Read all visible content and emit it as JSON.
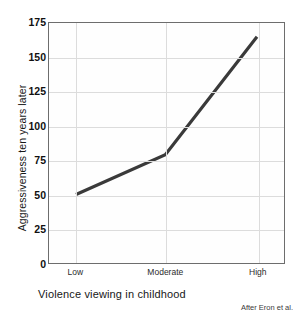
{
  "chart_data": {
    "type": "line",
    "title": "",
    "subtitle": "",
    "xlabel": "Violence viewing in childhood",
    "ylabel": "Aggressiveness ten years later",
    "categories": [
      "Low",
      "Moderate",
      "High"
    ],
    "values": [
      50,
      79,
      165
    ],
    "series": [
      {
        "name": "Aggressiveness",
        "values": [
          50,
          79,
          165
        ]
      }
    ],
    "ylim": [
      0,
      175
    ],
    "yticks": [
      0,
      25,
      50,
      75,
      100,
      125,
      150,
      175
    ],
    "ytick_labels": [
      "0",
      "25",
      "50",
      "75",
      "100",
      "125",
      "150",
      "175"
    ],
    "xtick_labels": [
      "Low",
      "Moderate",
      "High"
    ],
    "grid": true,
    "legend": false,
    "legend_position": "none",
    "annotations": [
      "After Eron et al."
    ],
    "line_color": "#3a3a3a",
    "grid_color": "#dcdcdc",
    "axis_color": "#6d6d6d",
    "background_color": "#ffffff"
  },
  "figure": {
    "source_note": "After Eron et al."
  }
}
